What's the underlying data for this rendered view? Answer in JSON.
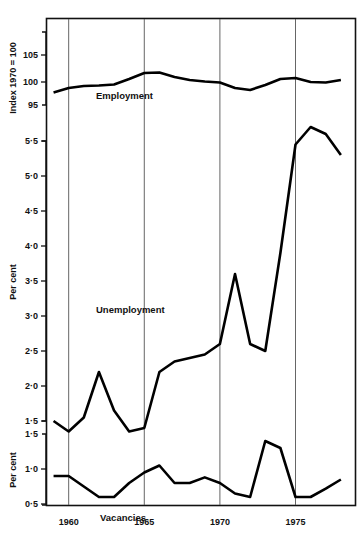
{
  "figure": {
    "background": "#ffffff",
    "line_color": "#000000",
    "frame_color": "#111111",
    "gridline_color": "#555555",
    "gridline_years": [
      1960,
      1965,
      1970,
      1975
    ]
  },
  "chart_data": [
    {
      "type": "line",
      "panel": "employment",
      "title": "",
      "series_label": "Employment",
      "ylabel": "Index 1970 = 100",
      "xlabel": "",
      "ytick_labels": [
        "105",
        "100",
        "95"
      ],
      "yticks": [
        105,
        100,
        95
      ],
      "ylim": [
        94,
        107
      ],
      "xlim": [
        1958.5,
        1979
      ],
      "grid": true,
      "x": [
        1959,
        1960,
        1961,
        1962,
        1963,
        1964,
        1965,
        1966,
        1967,
        1968,
        1969,
        1970,
        1971,
        1972,
        1973,
        1974,
        1975,
        1976,
        1977,
        1978
      ],
      "values": [
        97.5,
        98.4,
        98.8,
        98.9,
        99.1,
        100.2,
        101.4,
        101.5,
        100.6,
        100.0,
        99.7,
        99.5,
        98.4,
        98.0,
        99.0,
        100.2,
        100.4,
        99.6,
        99.5,
        100.0,
        100.4
      ]
    },
    {
      "type": "line",
      "panel": "unemployment",
      "title": "",
      "series_label": "Unemployment",
      "ylabel": "Per cent",
      "xlabel": "",
      "ytick_labels": [
        "5·5",
        "5·0",
        "4·5",
        "4·0",
        "3·5",
        "3·0",
        "2·5",
        "2·0",
        "1·5"
      ],
      "yticks": [
        5.5,
        5.0,
        4.5,
        4.0,
        3.5,
        3.0,
        2.5,
        2.0,
        1.5
      ],
      "ylim": [
        1.15,
        5.9
      ],
      "xlim": [
        1958.5,
        1979
      ],
      "grid": true,
      "x": [
        1959,
        1960,
        1961,
        1962,
        1963,
        1964,
        1965,
        1966,
        1967,
        1968,
        1969,
        1970,
        1971,
        1972,
        1973,
        1974,
        1975,
        1976,
        1977,
        1978
      ],
      "values": [
        1.5,
        1.35,
        1.55,
        2.2,
        1.65,
        1.35,
        1.4,
        2.2,
        2.35,
        2.4,
        2.45,
        2.6,
        3.6,
        2.6,
        2.5,
        3.9,
        5.45,
        5.7,
        5.6,
        5.3
      ]
    },
    {
      "type": "line",
      "panel": "vacancies",
      "title": "",
      "series_label": "Vacancies",
      "ylabel": "Per cent",
      "xlabel": "",
      "ytick_labels": [
        "1·5",
        "1·0",
        "0·5"
      ],
      "yticks": [
        1.5,
        1.0,
        0.5
      ],
      "ylim": [
        0.25,
        1.62
      ],
      "xlim": [
        1958.5,
        1979
      ],
      "grid": true,
      "x": [
        1959,
        1960,
        1961,
        1962,
        1963,
        1964,
        1965,
        1966,
        1967,
        1968,
        1969,
        1970,
        1971,
        1972,
        1973,
        1974,
        1975,
        1976,
        1977,
        1978
      ],
      "values": [
        0.9,
        0.9,
        0.75,
        0.6,
        0.6,
        0.8,
        0.95,
        1.05,
        0.8,
        0.8,
        0.88,
        0.8,
        0.65,
        0.6,
        1.4,
        1.3,
        0.6,
        0.6,
        0.72,
        0.85,
        1.0
      ]
    }
  ],
  "xaxis": {
    "tick_labels": [
      "1960",
      "1965",
      "1970",
      "1975"
    ],
    "tick_values": [
      1960,
      1965,
      1970,
      1975
    ]
  }
}
